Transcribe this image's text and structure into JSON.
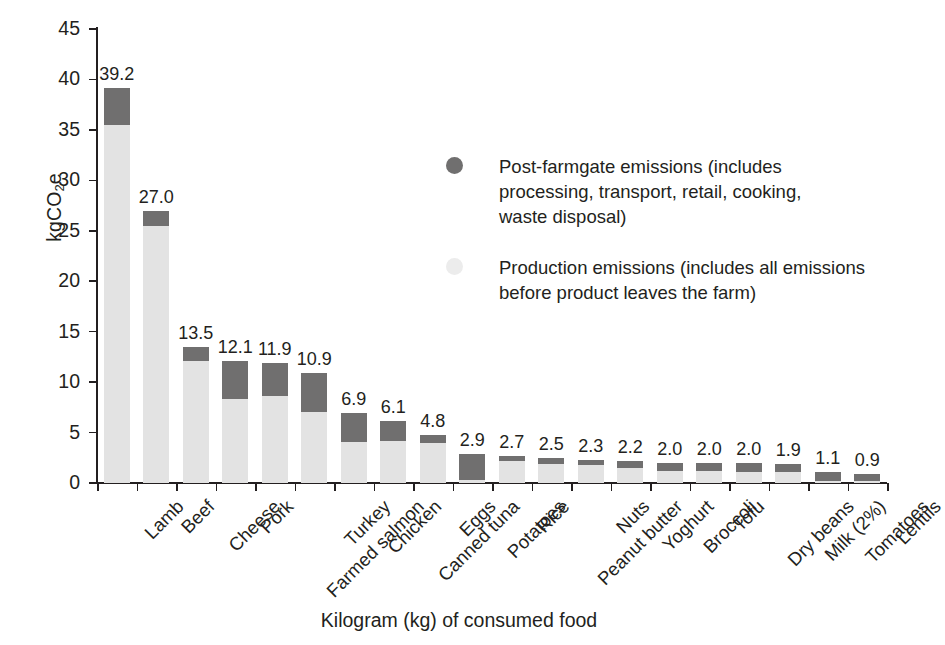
{
  "chart_data": {
    "type": "bar",
    "subtype": "stacked-vertical",
    "title": "",
    "xlabel": "Kilogram (kg) of consumed food",
    "ylabel": "kgCO2e",
    "ylabel_parts": {
      "pre": "kgCO",
      "sub": "2",
      "post": "e"
    },
    "ylim": [
      0,
      45
    ],
    "yticks": [
      0,
      5,
      10,
      15,
      20,
      25,
      30,
      35,
      40,
      45
    ],
    "ytick_labels": [
      "0",
      "5",
      "10",
      "15",
      "20",
      "25",
      "30",
      "35",
      "40",
      "45"
    ],
    "grid": false,
    "legend_position": "inside-upper-right",
    "categories": [
      "Lamb",
      "Beef",
      "Cheese",
      "Pork",
      "Farmed salmon",
      "Turkey",
      "Chicken",
      "Canned tuna",
      "Eggs",
      "Potatoes",
      "Rice",
      "Peanut butter",
      "Nuts",
      "Yoghurt",
      "Broccoli",
      "Tofu",
      "Dry beans",
      "Milk (2%)",
      "Tomatoes",
      "Lentils"
    ],
    "totals": [
      39.2,
      27.0,
      13.5,
      12.1,
      11.9,
      10.9,
      6.9,
      6.1,
      4.8,
      2.9,
      2.7,
      2.5,
      2.3,
      2.2,
      2.0,
      2.0,
      2.0,
      1.9,
      1.1,
      0.9
    ],
    "total_labels": [
      "39.2",
      "27.0",
      "13.5",
      "12.1",
      "11.9",
      "10.9",
      "6.9",
      "6.1",
      "4.8",
      "2.9",
      "2.7",
      "2.5",
      "2.3",
      "2.2",
      "2.0",
      "2.0",
      "2.0",
      "1.9",
      "1.1",
      "0.9"
    ],
    "series": [
      {
        "name": "Production emissions (includes all emissions before product leaves the farm)",
        "short_name": "Production emissions",
        "color": "#e3e3e3",
        "values": [
          35.5,
          25.5,
          12.1,
          8.3,
          8.6,
          7.0,
          4.1,
          4.2,
          4.0,
          0.3,
          2.2,
          1.9,
          1.8,
          1.5,
          1.2,
          1.2,
          1.1,
          1.1,
          0.2,
          0.15
        ]
      },
      {
        "name": "Post-farmgate emissions (includes processing, transport, retail, cooking, waste disposal)",
        "short_name": "Post-farmgate emissions",
        "color": "#706f6f",
        "values": [
          3.7,
          1.5,
          1.4,
          3.8,
          3.3,
          3.9,
          2.8,
          1.9,
          0.8,
          2.6,
          0.5,
          0.6,
          0.5,
          0.7,
          0.8,
          0.8,
          0.9,
          0.8,
          0.9,
          0.75
        ]
      }
    ]
  },
  "legend": {
    "items": [
      {
        "marker": "post-farmgate-swatch",
        "lines": [
          "Post-farmgate emissions (includes",
          "processing, transport, retail, cooking,",
          "waste disposal)"
        ]
      },
      {
        "marker": "production-swatch",
        "lines": [
          "Production emissions (includes all emissions",
          "before product leaves the farm)"
        ]
      }
    ]
  },
  "colors": {
    "post_farmgate": "#706f6f",
    "production": "#e3e3e3",
    "axis": "#231f20",
    "background": "#ffffff"
  }
}
